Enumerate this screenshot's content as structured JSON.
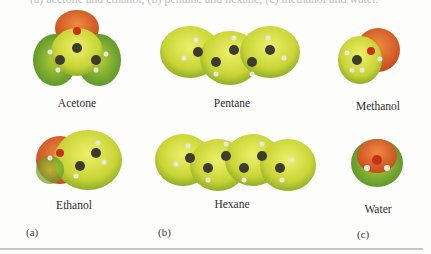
{
  "caption_fragment": "(a) acetone and ethanol, (b) pentane and hexane, (c) methanol and water.",
  "molecules": [
    {
      "name": "Acetone",
      "panel": "a"
    },
    {
      "name": "Ethanol",
      "panel": "a"
    },
    {
      "name": "Pentane",
      "panel": "b"
    },
    {
      "name": "Hexane",
      "panel": "b"
    },
    {
      "name": "Methanol",
      "panel": "c"
    },
    {
      "name": "Water",
      "panel": "c"
    }
  ],
  "panels": {
    "a": "(a)",
    "b": "(b)",
    "c": "(c)"
  },
  "colors": {
    "negative": "#d9602a",
    "neutral": "#c8d83a",
    "positive": "#4e9a2e",
    "carbon": "#3b3b30",
    "oxygen": "#c8301a",
    "hydrogen": "#e8e8e0"
  }
}
